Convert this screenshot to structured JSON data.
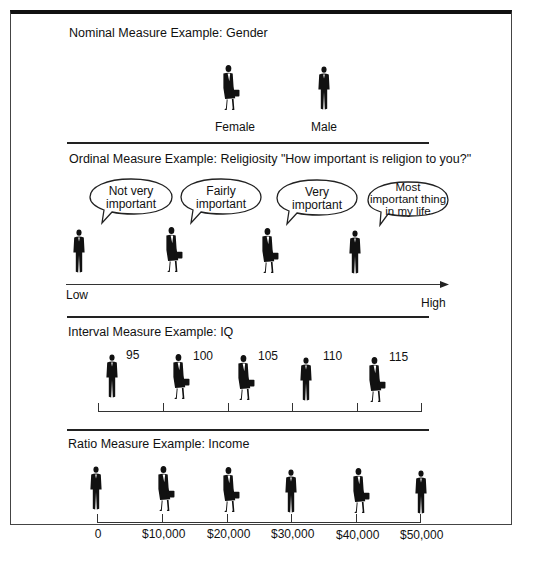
{
  "nominal": {
    "title": "Nominal Measure Example:  Gender",
    "categories": [
      {
        "label": "Female",
        "figure": "woman"
      },
      {
        "label": "Male",
        "figure": "man"
      }
    ]
  },
  "ordinal": {
    "title": "Ordinal Measure Example:  Religiosity  \"How important is religion to you?\"",
    "responses": [
      {
        "text": "Not very\nimportant",
        "figure": "man"
      },
      {
        "text": "Fairly\nimportant",
        "figure": "woman"
      },
      {
        "text": "Very\nimportant",
        "figure": "woman"
      },
      {
        "text": "Most\nimportant thing\nin my life",
        "figure": "man"
      }
    ],
    "axis_low": "Low",
    "axis_high": "High"
  },
  "interval": {
    "title": "Interval Measure Example:  IQ",
    "values": [
      {
        "label": "95",
        "figure": "man"
      },
      {
        "label": "100",
        "figure": "woman"
      },
      {
        "label": "105",
        "figure": "woman"
      },
      {
        "label": "110",
        "figure": "man"
      },
      {
        "label": "115",
        "figure": "woman"
      }
    ]
  },
  "ratio": {
    "title": "Ratio Measure Example:  Income",
    "values": [
      {
        "label": "0",
        "figure": "man"
      },
      {
        "label": "$10,000",
        "figure": "woman"
      },
      {
        "label": "$20,000",
        "figure": "woman"
      },
      {
        "label": "$30,000",
        "figure": "man"
      },
      {
        "label": "$40,000",
        "figure": "woman"
      },
      {
        "label": "$50,000",
        "figure": "man"
      }
    ]
  }
}
